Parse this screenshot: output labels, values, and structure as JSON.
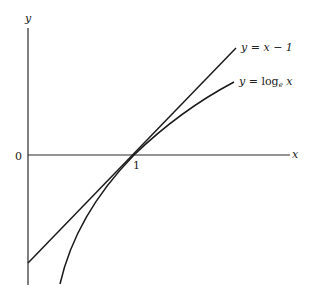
{
  "figure": {
    "type": "function-plot",
    "axes": {
      "x_label": "x",
      "y_label": "y",
      "origin_label": "0",
      "tick_label_1": "1"
    },
    "curves": [
      {
        "name": "line",
        "label": "y = x − 1",
        "label_parts": {
          "y": "y",
          "eq": " = ",
          "rhs": "x − 1"
        }
      },
      {
        "name": "log",
        "label": "y = logₑ x",
        "label_parts": {
          "y": "y",
          "eq": " = ",
          "fn": "log",
          "sub": "e",
          "arg": " x"
        }
      }
    ],
    "colors": {
      "ink": "#1a1a1a",
      "background": "#ffffff"
    }
  }
}
